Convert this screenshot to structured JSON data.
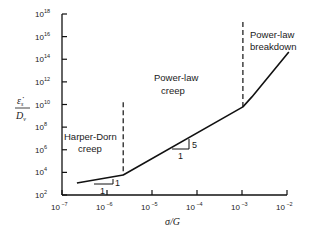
{
  "chart_data": {
    "type": "line",
    "title": "",
    "xlabel": "σ/G",
    "ylabel": "ε̇s / Dv",
    "xscale": "log",
    "yscale": "log",
    "xlim": [
      1e-07,
      0.01
    ],
    "ylim": [
      100.0,
      1e+18
    ],
    "x_ticks": [
      "10^-7",
      "10^-6",
      "10^-5",
      "10^-4",
      "10^-3",
      "10^-2"
    ],
    "y_ticks": [
      "10^2",
      "10^4",
      "10^6",
      "10^8",
      "10^10",
      "10^12",
      "10^14",
      "10^16",
      "10^18"
    ],
    "grid": false,
    "series": [
      {
        "name": "creep curve",
        "log10_x": [
          -6.67,
          -5.64,
          -2.98,
          -2.78,
          -1.96
        ],
        "log10_y": [
          3.06,
          3.77,
          9.79,
          10.67,
          14.65
        ]
      }
    ],
    "boundaries": [
      {
        "log10_x": -5.64,
        "log10_y_range": [
          3.77,
          10.2
        ],
        "style": "dashed"
      },
      {
        "log10_x": -2.98,
        "log10_y_range": [
          9.79,
          17.3
        ],
        "style": "dashed"
      }
    ],
    "annotations": [
      {
        "text": "Harper-Dorn creep",
        "region": "low stress"
      },
      {
        "text": "Power-law creep",
        "region": "intermediate stress"
      },
      {
        "text": "Power-law breakdown",
        "region": "high stress"
      },
      {
        "text": "slope 1 (run 1, rise 1)",
        "region": "Harper-Dorn"
      },
      {
        "text": "slope 5 (run 1, rise 5)",
        "region": "power-law creep"
      }
    ]
  },
  "labels": {
    "x_axis_main": "σ/G",
    "y_axis_num": "ε̇",
    "y_axis_num_sub": "s",
    "y_axis_den": "D",
    "y_axis_den_sub": "v",
    "region_hd_1": "Harper-Dorn",
    "region_hd_2": "creep",
    "region_pl_1": "Power-law",
    "region_pl_2": "creep",
    "region_br_1": "Power-law",
    "region_br_2": "breakdown",
    "tri1_rise": "1",
    "tri1_run": "1",
    "tri2_rise": "5",
    "tri2_run": "1"
  },
  "colors": {
    "line": "#111111",
    "axis": "#111111"
  }
}
